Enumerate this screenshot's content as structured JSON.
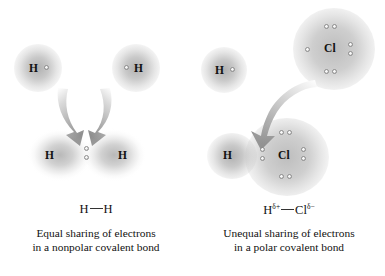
{
  "figure": {
    "title": "",
    "background_color": "#ffffff",
    "cloud_color": "#8c8c8c",
    "arrow_color": "#b3b3b3",
    "text_color": "#111111"
  },
  "panels": [
    {
      "id": "nonpolar",
      "separated_atoms": [
        {
          "symbol": "H",
          "electron_count": 1,
          "electron_side": "right"
        },
        {
          "symbol": "H",
          "electron_count": 1,
          "electron_side": "left"
        }
      ],
      "arrows": {
        "count": 2,
        "direction": "down-converging"
      },
      "bonded_molecule": {
        "atoms": [
          {
            "symbol": "H"
          },
          {
            "symbol": "H"
          }
        ],
        "shared_pair_position": "center",
        "cloud_shape": "symmetric-merged",
        "lone_pairs": 0
      },
      "formula": {
        "left_atom": "H",
        "left_charge": "",
        "right_atom": "H",
        "right_charge": ""
      },
      "caption_line_1": "Equal sharing of electrons",
      "caption_line_2": "in a nonpolar covalent bond"
    },
    {
      "id": "polar",
      "separated_atoms": [
        {
          "symbol": "H",
          "electron_count": 1,
          "electron_side": "right"
        },
        {
          "symbol": "Cl",
          "electron_count": 7,
          "electron_side": "all",
          "lone_pairs": 3,
          "single_electron_side": "left"
        }
      ],
      "arrows": {
        "count": 1,
        "direction": "down-right-curving"
      },
      "bonded_molecule": {
        "atoms": [
          {
            "symbol": "H"
          },
          {
            "symbol": "Cl"
          }
        ],
        "shared_pair_position": "shifted-toward-chlorine",
        "cloud_shape": "asymmetric-distorted",
        "lone_pairs": 3
      },
      "formula": {
        "left_atom": "H",
        "left_charge": "δ+",
        "right_atom": "Cl",
        "right_charge": "δ−"
      },
      "caption_line_1": "Unequal sharing of electrons",
      "caption_line_2": "in a polar covalent bond"
    }
  ]
}
